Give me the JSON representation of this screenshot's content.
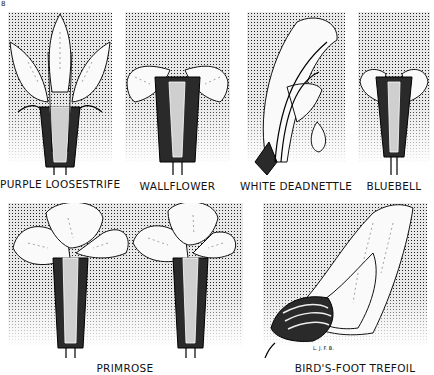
{
  "figure": {
    "corner_mark": "8",
    "signature": "L. J. F. B.",
    "panels": [
      {
        "id": "purple-loosestrife",
        "label": "PURPLE LOOSESTRIFE"
      },
      {
        "id": "wallflower",
        "label": "WALLFLOWER"
      },
      {
        "id": "white-deadnettle",
        "label": "WHITE DEADNETTLE"
      },
      {
        "id": "bluebell",
        "label": "BLUEBELL"
      },
      {
        "id": "primrose",
        "label": "PRIMROSE"
      },
      {
        "id": "birds-foot-trefoil",
        "label": "BIRD'S-FOOT TREFOIL"
      }
    ]
  }
}
